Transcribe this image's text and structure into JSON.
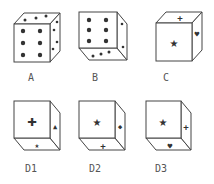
{
  "figure": {
    "colors": {
      "stroke": "#444444",
      "fill": "#ffffff",
      "symbol": "#333333",
      "label": "#555555"
    },
    "cubes": [
      {
        "id": "A",
        "label": "A",
        "orientation": "top-right",
        "front": "six-dots",
        "top": "three-dots",
        "side": "four-dots"
      },
      {
        "id": "B",
        "label": "B",
        "orientation": "bottom-right",
        "front": "six-dots",
        "side": "two-dots",
        "bottom": "three-dots"
      },
      {
        "id": "C",
        "label": "C",
        "orientation": "top-right",
        "front": "star",
        "top": "plus",
        "side": "heart"
      },
      {
        "id": "D1",
        "label": "D1",
        "orientation": "bottom-right",
        "front": "plus",
        "side": "triangle",
        "bottom": "star"
      },
      {
        "id": "D2",
        "label": "D2",
        "orientation": "bottom-right",
        "front": "star",
        "side": "diamond",
        "bottom": "plus"
      },
      {
        "id": "D3",
        "label": "D3",
        "orientation": "bottom-right",
        "front": "star",
        "side": "plus",
        "bottom": "heart"
      }
    ]
  }
}
